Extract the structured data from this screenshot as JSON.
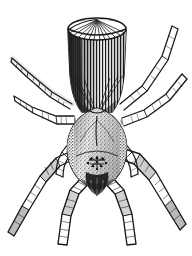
{
  "figure": {
    "view": "dorsal",
    "medium": "black-and-white line engraving",
    "background_color": "#ffffff",
    "ink_color": "#1a1a1a",
    "caption": "",
    "width_px": 192,
    "height_px": 256
  },
  "anatomy": {
    "abdomen": {
      "name": "abdomen",
      "shape": "truncated cylinder with flat disc-like top",
      "texture": "radiating lines on top disc, dense vertical striations on body",
      "shading": "heavy black shading along left flank",
      "top_center_x": 96,
      "top_y": 18,
      "bottom_y": 112
    },
    "carapace": {
      "name": "cephalothorax",
      "shape": "rounded oval",
      "texture": "fine stipple",
      "center_x": 97,
      "center_y": 140
    },
    "eyes": {
      "name": "eye-cluster",
      "count_visible": 8,
      "center_x": 97,
      "center_y": 163
    },
    "chelicerae": {
      "name": "chelicerae",
      "shape": "dark paired fang bases",
      "center_x": 97,
      "center_y": 178
    },
    "legs": [
      {
        "id": "L1",
        "side": "left",
        "label": "leg-left-1",
        "direction": "upper-left"
      },
      {
        "id": "L2",
        "side": "left",
        "label": "leg-left-2",
        "direction": "left"
      },
      {
        "id": "L3",
        "side": "left",
        "label": "leg-left-3",
        "direction": "lower-left"
      },
      {
        "id": "L4",
        "side": "left",
        "label": "leg-left-4",
        "direction": "down"
      },
      {
        "id": "R1",
        "side": "right",
        "label": "leg-right-1",
        "direction": "upper-right"
      },
      {
        "id": "R2",
        "side": "right",
        "label": "leg-right-2",
        "direction": "right"
      },
      {
        "id": "R3",
        "side": "right",
        "label": "leg-right-3",
        "direction": "lower-right"
      },
      {
        "id": "R4",
        "side": "right",
        "label": "leg-right-4",
        "direction": "down"
      }
    ],
    "pedipalps": [
      {
        "id": "P-left",
        "label": "pedipalp-left"
      },
      {
        "id": "P-right",
        "label": "pedipalp-right"
      }
    ]
  }
}
